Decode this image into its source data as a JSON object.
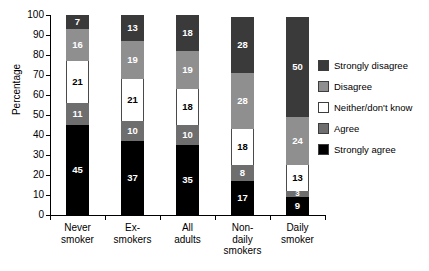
{
  "chart_data": {
    "type": "bar",
    "subtype": "stacked-bar-100",
    "title": "",
    "xlabel": "",
    "ylabel": "Percentage",
    "ylim": [
      0,
      100
    ],
    "yticks": [
      0,
      10,
      20,
      30,
      40,
      50,
      60,
      70,
      80,
      90,
      100
    ],
    "grid": false,
    "legend_position": "right",
    "categories": [
      "Never smoker",
      "Ex-smokers",
      "All adults",
      "Non-daily smokers",
      "Daily smoker"
    ],
    "category_lines": [
      [
        "Never",
        "smoker"
      ],
      [
        "Ex-",
        "smokers"
      ],
      [
        "All",
        "adults"
      ],
      [
        "Non-",
        "daily",
        "smokers"
      ],
      [
        "Daily",
        "smoker"
      ]
    ],
    "series": [
      {
        "name": "Strongly agree",
        "color": "#000000",
        "values": [
          45,
          37,
          35,
          17,
          9
        ]
      },
      {
        "name": "Agree",
        "color": "#6e6e6e",
        "values": [
          11,
          10,
          10,
          8,
          3
        ]
      },
      {
        "name": "Neither/don't know",
        "color": "#ffffff",
        "values": [
          21,
          21,
          18,
          18,
          13
        ]
      },
      {
        "name": "Disagree",
        "color": "#8f8f8f",
        "values": [
          16,
          19,
          19,
          28,
          24
        ]
      },
      {
        "name": "Strongly disagree",
        "color": "#3a3a3a",
        "values": [
          7,
          13,
          18,
          28,
          50
        ]
      }
    ],
    "totals": [
      100,
      100,
      100,
      99,
      99
    ]
  },
  "legend": {
    "items": [
      {
        "label": "Strongly disagree",
        "color": "#3a3a3a"
      },
      {
        "label": "Disagree",
        "color": "#8f8f8f"
      },
      {
        "label": "Neither/don't know",
        "color": "#ffffff"
      },
      {
        "label": "Agree",
        "color": "#6e6e6e"
      },
      {
        "label": "Strongly agree",
        "color": "#000000"
      }
    ]
  },
  "axes": {
    "y_title": "Percentage",
    "y_tick_labels": [
      "0",
      "10",
      "20",
      "30",
      "40",
      "50",
      "60",
      "70",
      "80",
      "90",
      "100"
    ]
  }
}
